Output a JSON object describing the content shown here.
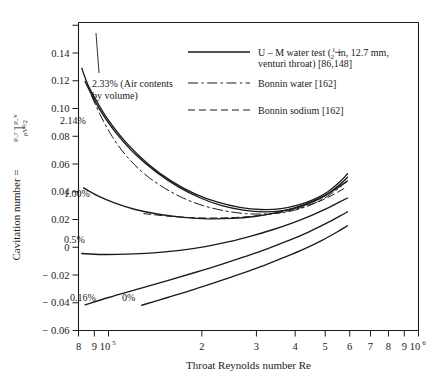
{
  "chart_data": {
    "type": "line",
    "title": "",
    "xlabel": "Throat Reynolds number Re",
    "ylabel": "Cavitation number",
    "ylabel_formula_numerator": "p_r − p_v",
    "ylabel_formula_denominator": "ρV²/2",
    "xscale": "log",
    "xlim": [
      80000,
      1000000
    ],
    "ylim": [
      -0.06,
      0.162
    ],
    "grid": false,
    "xticks": [
      {
        "value": 80000,
        "label": "8"
      },
      {
        "value": 90000,
        "label": "9"
      },
      {
        "value": 100000,
        "label": "10",
        "sup": "5"
      },
      {
        "value": 200000,
        "label": "2"
      },
      {
        "value": 300000,
        "label": "3"
      },
      {
        "value": 400000,
        "label": "4"
      },
      {
        "value": 500000,
        "label": "5"
      },
      {
        "value": 600000,
        "label": "6"
      },
      {
        "value": 700000,
        "label": "7"
      },
      {
        "value": 800000,
        "label": "8"
      },
      {
        "value": 900000,
        "label": "9"
      },
      {
        "value": 1000000,
        "label": "10",
        "sup": "6"
      }
    ],
    "yticks": [
      {
        "value": 0.16,
        "label": ""
      },
      {
        "value": 0.14,
        "label": "0.14"
      },
      {
        "value": 0.12,
        "label": "0.12"
      },
      {
        "value": 0.1,
        "label": "0.10"
      },
      {
        "value": 0.08,
        "label": "0.08"
      },
      {
        "value": 0.06,
        "label": "0.06"
      },
      {
        "value": 0.04,
        "label": "0.04"
      },
      {
        "value": 0.02,
        "label": "0.02"
      },
      {
        "value": 0.0,
        "label": "0"
      },
      {
        "value": -0.02,
        "label": "− 0.02"
      },
      {
        "value": -0.04,
        "label": "− 0.04"
      },
      {
        "value": -0.06,
        "label": "− 0.06"
      }
    ],
    "legend": {
      "position": "upper-right-inside",
      "entries": [
        {
          "label": "U – M water test (½ in, 12.7 mm, venturi throat) [86,148]",
          "label_line1_pre": "U – M water test (",
          "label_line1_post": " in, 12.7 mm,",
          "label_line2": "venturi throat) [86,148]",
          "frac_num": "1",
          "frac_den": "2",
          "style": "solid"
        },
        {
          "label": "Bonnin water [162]",
          "style": "dash-dot"
        },
        {
          "label": "Bonnin sodium [162]",
          "style": "dashed"
        }
      ]
    },
    "annotations": [
      {
        "text": "2.33% (Air contents",
        "x_px": 92,
        "y_px": 87
      },
      {
        "text": "by volume)",
        "x_px": 92,
        "y_px": 99
      },
      {
        "text": "2.14%",
        "x_px": 60,
        "y_px": 124
      },
      {
        "text": "1.00%",
        "x_px": 64,
        "y_px": 197
      },
      {
        "text": "0.5%",
        "x_px": 64,
        "y_px": 243
      },
      {
        "text": "0.16%",
        "x_px": 70,
        "y_px": 301
      },
      {
        "text": "0%",
        "x_px": 122,
        "y_px": 301
      }
    ],
    "series": [
      {
        "name": "2.33% air content (U-M water test)",
        "style": "solid",
        "points": [
          [
            82000,
            0.129
          ],
          [
            86000,
            0.1165
          ],
          [
            92000,
            0.1045
          ],
          [
            100000,
            0.0915
          ],
          [
            115000,
            0.0745
          ],
          [
            135000,
            0.0595
          ],
          [
            160000,
            0.0475
          ],
          [
            190000,
            0.0385
          ],
          [
            225000,
            0.0325
          ],
          [
            265000,
            0.0288
          ],
          [
            310000,
            0.0272
          ],
          [
            360000,
            0.0278
          ],
          [
            410000,
            0.0305
          ],
          [
            460000,
            0.0345
          ],
          [
            510000,
            0.04
          ],
          [
            560000,
            0.0475
          ],
          [
            590000,
            0.053
          ]
        ]
      },
      {
        "name": "2.14% air content (U-M water test)",
        "style": "solid",
        "points": [
          [
            84000,
            0.1195
          ],
          [
            90000,
            0.106
          ],
          [
            97000,
            0.094
          ],
          [
            107000,
            0.081
          ],
          [
            122000,
            0.067
          ],
          [
            142000,
            0.0545
          ],
          [
            168000,
            0.0435
          ],
          [
            198000,
            0.0355
          ],
          [
            232000,
            0.03
          ],
          [
            272000,
            0.0268
          ],
          [
            315000,
            0.0255
          ],
          [
            360000,
            0.0262
          ],
          [
            410000,
            0.0288
          ],
          [
            460000,
            0.033
          ],
          [
            510000,
            0.0385
          ],
          [
            560000,
            0.0455
          ],
          [
            590000,
            0.0505
          ]
        ]
      },
      {
        "name": "Bonnin water (steep branch)",
        "style": "dash-dot",
        "points": [
          [
            88000,
            0.1095
          ],
          [
            94000,
            0.0955
          ],
          [
            102000,
            0.081
          ],
          [
            113000,
            0.067
          ],
          [
            128000,
            0.0545
          ],
          [
            147000,
            0.0445
          ],
          [
            172000,
            0.036
          ],
          [
            202000,
            0.03
          ],
          [
            238000,
            0.0262
          ],
          [
            278000,
            0.0242
          ],
          [
            322000,
            0.024
          ],
          [
            370000,
            0.0252
          ],
          [
            420000,
            0.0282
          ],
          [
            470000,
            0.0325
          ],
          [
            520000,
            0.0382
          ],
          [
            565000,
            0.0442
          ]
        ]
      },
      {
        "name": "1.00% air content (U-M water test)",
        "style": "solid",
        "points": [
          [
            83000,
            0.0428
          ],
          [
            92000,
            0.0372
          ],
          [
            105000,
            0.0318
          ],
          [
            122000,
            0.0272
          ],
          [
            145000,
            0.0238
          ],
          [
            175000,
            0.0215
          ],
          [
            210000,
            0.0205
          ],
          [
            250000,
            0.0208
          ],
          [
            295000,
            0.0222
          ],
          [
            345000,
            0.0248
          ],
          [
            400000,
            0.0285
          ],
          [
            455000,
            0.033
          ],
          [
            510000,
            0.0385
          ],
          [
            560000,
            0.0442
          ],
          [
            590000,
            0.0478
          ]
        ]
      },
      {
        "name": "Bonnin sodium",
        "style": "dashed",
        "points": [
          [
            130000,
            0.0242
          ],
          [
            160000,
            0.0222
          ],
          [
            195000,
            0.0212
          ],
          [
            235000,
            0.0212
          ],
          [
            280000,
            0.022
          ],
          [
            330000,
            0.0238
          ],
          [
            385000,
            0.0265
          ],
          [
            440000,
            0.0302
          ],
          [
            495000,
            0.0345
          ],
          [
            550000,
            0.0398
          ],
          [
            585000,
            0.0435
          ]
        ]
      },
      {
        "name": "0.5% air content (U-M water test)",
        "style": "solid",
        "points": [
          [
            82000,
            -0.0045
          ],
          [
            95000,
            -0.0052
          ],
          [
            115000,
            -0.005
          ],
          [
            140000,
            -0.004
          ],
          [
            170000,
            -0.0022
          ],
          [
            205000,
            0.0005
          ],
          [
            245000,
            0.004
          ],
          [
            290000,
            0.0082
          ],
          [
            340000,
            0.0128
          ],
          [
            395000,
            0.0178
          ],
          [
            450000,
            0.0228
          ],
          [
            505000,
            0.0278
          ],
          [
            555000,
            0.0325
          ],
          [
            590000,
            0.0355
          ]
        ]
      },
      {
        "name": "0.16% air content (U-M water test)",
        "style": "solid",
        "points": [
          [
            84000,
            -0.0415
          ],
          [
            100000,
            -0.0362
          ],
          [
            125000,
            -0.03
          ],
          [
            155000,
            -0.024
          ],
          [
            190000,
            -0.0182
          ],
          [
            230000,
            -0.0125
          ],
          [
            275000,
            -0.0068
          ],
          [
            325000,
            -0.0012
          ],
          [
            380000,
            0.0048
          ],
          [
            440000,
            0.0108
          ],
          [
            500000,
            0.0168
          ],
          [
            555000,
            0.0222
          ],
          [
            590000,
            0.0255
          ]
        ]
      },
      {
        "name": "0% air content (U-M water test)",
        "style": "solid",
        "points": [
          [
            128000,
            -0.0418
          ],
          [
            155000,
            -0.0362
          ],
          [
            188000,
            -0.0305
          ],
          [
            225000,
            -0.0248
          ],
          [
            268000,
            -0.019
          ],
          [
            318000,
            -0.013
          ],
          [
            372000,
            -0.007
          ],
          [
            430000,
            -0.001
          ],
          [
            490000,
            0.0052
          ],
          [
            548000,
            0.0112
          ],
          [
            590000,
            0.0155
          ]
        ]
      }
    ]
  },
  "colors": {
    "ink": "#1a1a1a",
    "background": "#ffffff",
    "axis": "#222222"
  }
}
